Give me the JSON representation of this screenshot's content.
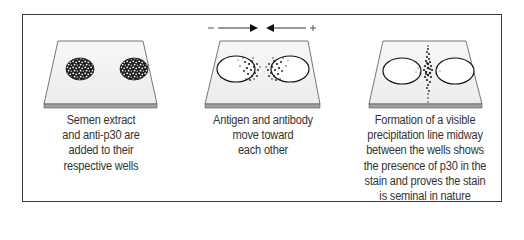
{
  "figure": {
    "panels": [
      {
        "id": "panel-1",
        "caption_lines": [
          "Semen extract",
          "and anti-p30 are",
          "added to their",
          "respective wells"
        ],
        "wells": [
          {
            "name": "left-well",
            "state": "filled"
          },
          {
            "name": "right-well",
            "state": "filled"
          }
        ]
      },
      {
        "id": "panel-2",
        "caption_lines": [
          "Antigen and antibody",
          "move toward",
          "each other"
        ],
        "polarity": {
          "left": "–",
          "right": "+"
        },
        "wells": [
          {
            "name": "left-well",
            "state": "diffusing-right"
          },
          {
            "name": "right-well",
            "state": "diffusing-left"
          }
        ]
      },
      {
        "id": "panel-3",
        "caption_lines": [
          "Formation of a visible",
          "precipitation line midway",
          "between the wells shows",
          "the presence of p30 in the",
          "stain and proves the stain",
          "is seminal in nature"
        ],
        "wells": [
          {
            "name": "left-well",
            "state": "empty"
          },
          {
            "name": "right-well",
            "state": "empty"
          }
        ],
        "precipitation_line": true
      }
    ]
  },
  "colors": {
    "border": "#3a3a3a",
    "plate_top": "#f2f2f2",
    "plate_edge": "#9a9a9a",
    "text": "#333333",
    "dots": "#222222"
  }
}
